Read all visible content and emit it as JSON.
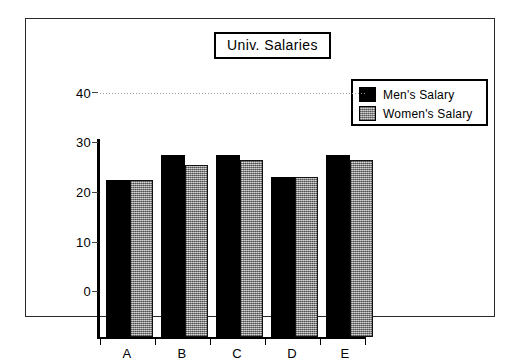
{
  "chart_data": {
    "type": "bar",
    "title": "Univ. Salaries",
    "xlabel": "",
    "ylabel": "",
    "categories": [
      "A",
      "B",
      "C",
      "D",
      "E"
    ],
    "series": [
      {
        "name": "Men's Salary",
        "color": "#000000",
        "values": [
          31.5,
          36.5,
          36.5,
          32.0,
          36.5
        ]
      },
      {
        "name": "Women's Salary",
        "color": "#a8a8a8",
        "values": [
          31.5,
          34.5,
          35.5,
          32.0,
          35.5
        ]
      }
    ],
    "ylim": [
      0,
      40
    ],
    "yticks": [
      0,
      10,
      20,
      30,
      40
    ],
    "ytick_labels": [
      "0",
      "10",
      "20",
      "30",
      "40"
    ],
    "grid": true,
    "gridlines_at": [
      40
    ],
    "legend_position": "top-right"
  },
  "legend": {
    "entries": [
      {
        "label": "Men's Salary",
        "swatch": "black-swatch"
      },
      {
        "label": "Women's Salary",
        "swatch": "gray-swatch"
      }
    ]
  }
}
